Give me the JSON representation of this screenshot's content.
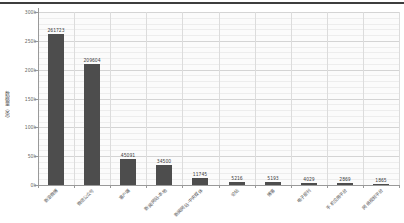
{
  "page": {
    "background": "#ffffff",
    "top_divider_color": "#3d3d3d"
  },
  "chart_data": {
    "type": "bar",
    "title": "",
    "categories": [
      "新浪微博",
      "微信公众号",
      "客户端",
      "新闻网站-本地",
      "新闻网站-中央媒体",
      "论坛",
      "博客",
      "电子报刊",
      "手机应用平台",
      "网络视频平台"
    ],
    "values": [
      261723,
      209604,
      45091,
      34500,
      11745,
      5216,
      5193,
      4029,
      2869,
      1865
    ],
    "value_labels": [
      "261723",
      "209604",
      "45091",
      "34500",
      "11745",
      "5216",
      "5193",
      "4029",
      "2869",
      "1865"
    ],
    "xlabel": "",
    "ylabel": "数据量（条）",
    "ylim": [
      0,
      300000
    ],
    "y_tick_step": 50000,
    "y_minor_step": 10000,
    "y_tick_labels": [
      "0k",
      "50k",
      "100k",
      "150k",
      "200k",
      "250k",
      "300k"
    ],
    "grid": true,
    "legend": "none",
    "bar_color": "#4d4d4d",
    "x_label_rotation": 45
  }
}
